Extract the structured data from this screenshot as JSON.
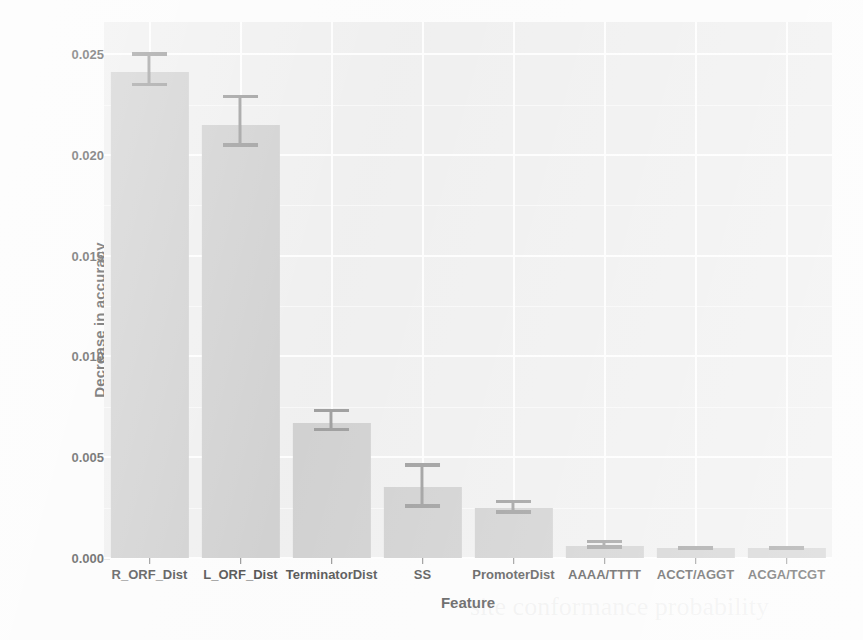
{
  "chart_data": {
    "type": "bar",
    "title": "",
    "xlabel": "Feature",
    "ylabel": "Decrease in accuracy",
    "categories": [
      "R_ORF_Dist",
      "L_ORF_Dist",
      "TerminatorDist",
      "SS",
      "PromoterDist",
      "AAAA/TTTT",
      "ACCT/AGGT",
      "ACGA/TCGT"
    ],
    "values": [
      0.0241,
      0.0215,
      0.0067,
      0.0035,
      0.0025,
      0.0006,
      0.0005,
      0.0005
    ],
    "error_low": [
      0.0234,
      0.0204,
      0.0063,
      0.0025,
      0.0022,
      0.00045,
      0.00042,
      0.00042
    ],
    "error_high": [
      0.0251,
      0.023,
      0.0074,
      0.0047,
      0.0029,
      0.0009,
      0.00058,
      0.00058
    ],
    "ylim": [
      0.0,
      0.0266
    ],
    "y_ticks": [
      0.0,
      0.005,
      0.01,
      0.015,
      0.02,
      0.025
    ],
    "y_tick_labels": [
      "0.000",
      "0.005",
      "0.010",
      "0.015",
      "0.020",
      "0.025"
    ],
    "grid": true,
    "legend": "none",
    "bar_color": "#c9c9c9",
    "error_color": "#8e8e8e",
    "panel_color": "#ededed",
    "grid_color": "#fdfdfd"
  },
  "axis": {
    "y_title": "Decrease in accuracy",
    "x_title": "Feature"
  },
  "ghost_text": {
    "line1": "site conformance probability",
    "line2": "quality"
  }
}
